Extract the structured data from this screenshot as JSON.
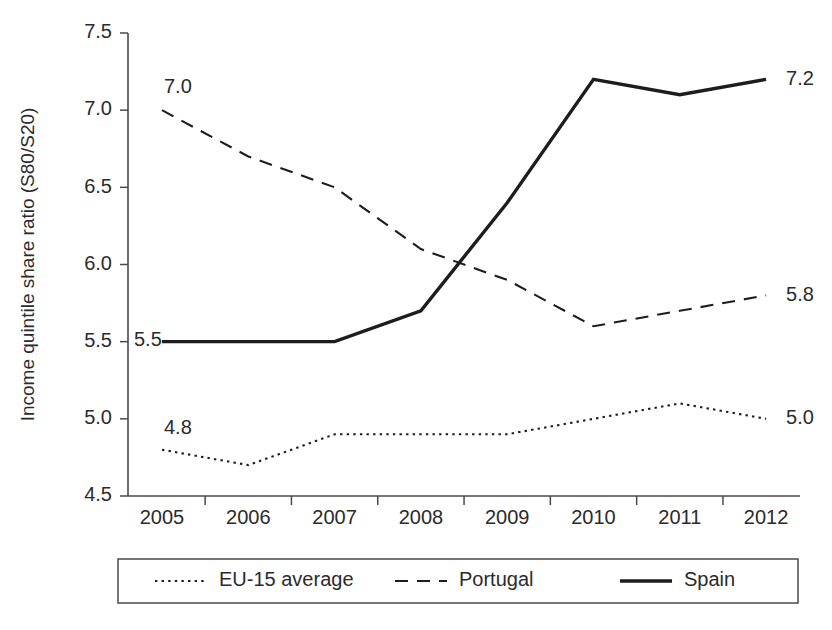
{
  "chart_data": {
    "type": "line",
    "title": "",
    "xlabel": "",
    "ylabel": "Income quintile share ratio (S80/S20)",
    "categories": [
      "2005",
      "2006",
      "2007",
      "2008",
      "2009",
      "2010",
      "2011",
      "2012"
    ],
    "ylim": [
      4.5,
      7.5
    ],
    "yticks": [
      "4.5",
      "5.0",
      "5.5",
      "6.0",
      "6.5",
      "7.0",
      "7.5"
    ],
    "ytick_values": [
      4.5,
      5.0,
      5.5,
      6.0,
      6.5,
      7.0,
      7.5
    ],
    "grid": false,
    "legend_position": "bottom",
    "series": [
      {
        "name": "EU-15 average",
        "style": "dotted",
        "color": "#1d1d1d",
        "values": [
          4.8,
          4.7,
          4.9,
          4.9,
          4.9,
          5.0,
          5.1,
          5.0
        ],
        "start_label": "4.8",
        "end_label": "5.0"
      },
      {
        "name": "Portugal",
        "style": "dashed",
        "color": "#1d1d1d",
        "values": [
          7.0,
          6.7,
          6.5,
          6.1,
          5.9,
          5.6,
          5.7,
          5.8
        ],
        "start_label": "7.0",
        "end_label": "5.8"
      },
      {
        "name": "Spain",
        "style": "solid",
        "color": "#1d1d1d",
        "values": [
          5.5,
          5.5,
          5.5,
          5.7,
          6.4,
          7.2,
          7.1,
          7.2
        ],
        "start_label": "5.5",
        "end_label": "7.2"
      }
    ],
    "annotations": [
      {
        "text": "7.0",
        "series": "Portugal",
        "position": "start"
      },
      {
        "text": "5.5",
        "series": "Spain",
        "position": "start"
      },
      {
        "text": "4.8",
        "series": "EU-15 average",
        "position": "start"
      },
      {
        "text": "7.2",
        "series": "Spain",
        "position": "end"
      },
      {
        "text": "5.8",
        "series": "Portugal",
        "position": "end"
      },
      {
        "text": "5.0",
        "series": "EU-15 average",
        "position": "end"
      }
    ]
  },
  "legend": {
    "items": [
      {
        "label": "EU-15 average",
        "style": "dotted"
      },
      {
        "label": "Portugal",
        "style": "dashed"
      },
      {
        "label": "Spain",
        "style": "solid"
      }
    ]
  },
  "colors": {
    "axis": "#4a4a4a",
    "text": "#2b2b2b",
    "line": "#1d1d1d",
    "background": "#ffffff"
  }
}
